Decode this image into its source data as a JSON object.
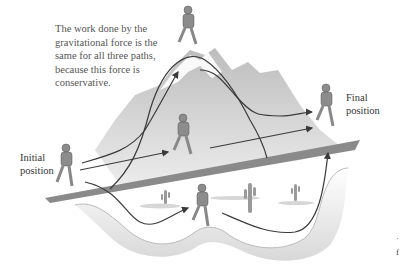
{
  "caption": {
    "lines": [
      "The work done by the",
      "gravitational force is the",
      "same for all three paths,",
      "because this force is",
      "conservative."
    ]
  },
  "labels": {
    "initial_line1": "Initial",
    "initial_line2": "position",
    "final_line1": "Final",
    "final_line2": "position",
    "cutoff_1": "˙",
    "cutoff_2": "f"
  },
  "figure": {
    "paths": [
      "over-mountain",
      "straight-road",
      "through-valley"
    ],
    "colors": {
      "mountain": "#c8c8c8",
      "mountain_light": "#e4e4e4",
      "road": "#8a8a8a",
      "path_line": "#3a3a3a",
      "runner": "#8c8c8c"
    }
  }
}
